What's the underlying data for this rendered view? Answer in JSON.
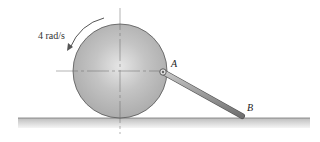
{
  "diagram": {
    "angular_velocity_label": "4 rad/s",
    "point_a_label": "A",
    "point_b_label": "B",
    "colors": {
      "disk": "#b8b8b8",
      "rod": "#9a9a9a",
      "ground": "#c8c8c8",
      "outline": "#555555"
    }
  }
}
